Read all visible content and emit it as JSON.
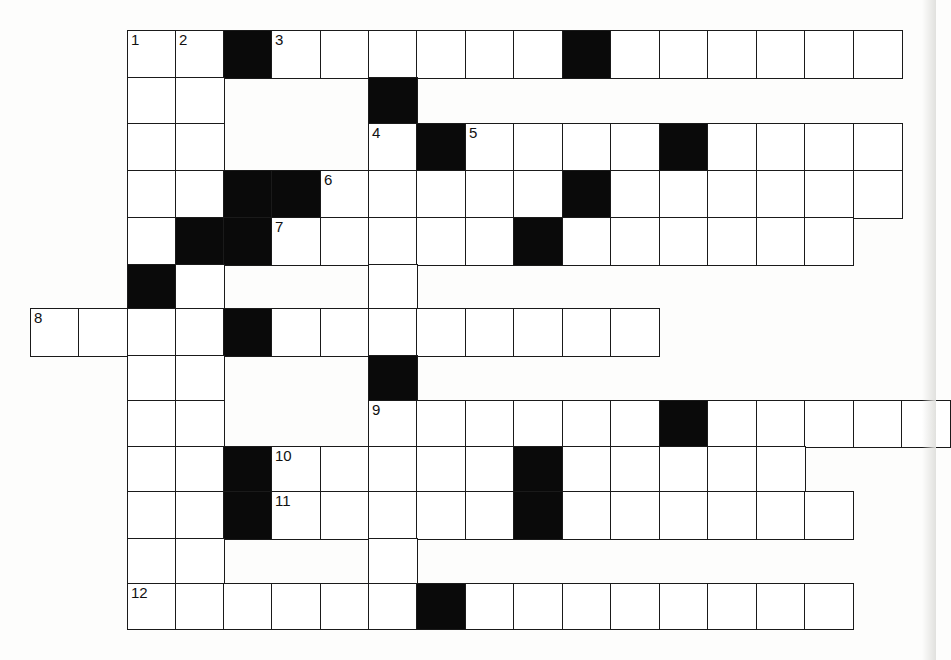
{
  "puzzle": {
    "type": "crossword",
    "colors": {
      "cell": "#ffffff",
      "block": "#0a0a0a",
      "line": "#1a1a1a",
      "background": "#fdfdfc"
    },
    "geometry": {
      "col_x": {
        "-2": 30,
        "-1": 78,
        "0": 127,
        "1": 175,
        "2": 223,
        "3": 271,
        "4": 320,
        "5": 368,
        "6": 416,
        "7": 465,
        "8": 513,
        "9": 562,
        "10": 610,
        "11": 659,
        "12": 707,
        "13": 756,
        "14": 804,
        "15": 853,
        "16": 901
      },
      "row_y": [
        30,
        77,
        123,
        170,
        217,
        264,
        308,
        355,
        400,
        446,
        491,
        538,
        583
      ],
      "row_h": [
        48,
        47,
        48,
        48,
        48,
        45,
        48,
        46,
        47,
        46,
        48,
        46,
        46
      ],
      "cell_w": 49
    },
    "rows": [
      {
        "r": 0,
        "cells": [
          {
            "c": 0,
            "n": "1"
          },
          {
            "c": 1,
            "n": "2"
          },
          {
            "c": 2,
            "b": true
          },
          {
            "c": 3,
            "n": "3"
          },
          {
            "c": 4
          },
          {
            "c": 5
          },
          {
            "c": 6
          },
          {
            "c": 7
          },
          {
            "c": 8
          },
          {
            "c": 9,
            "b": true
          },
          {
            "c": 10
          },
          {
            "c": 11
          },
          {
            "c": 12
          },
          {
            "c": 13
          },
          {
            "c": 14
          },
          {
            "c": 15
          }
        ]
      },
      {
        "r": 1,
        "cells": [
          {
            "c": 0
          },
          {
            "c": 1
          },
          {
            "c": 5,
            "b": true
          }
        ]
      },
      {
        "r": 2,
        "cells": [
          {
            "c": 0
          },
          {
            "c": 1
          },
          {
            "c": 5,
            "n": "4"
          },
          {
            "c": 6,
            "b": true
          },
          {
            "c": 7,
            "n": "5"
          },
          {
            "c": 8
          },
          {
            "c": 9
          },
          {
            "c": 10
          },
          {
            "c": 11,
            "b": true
          },
          {
            "c": 12
          },
          {
            "c": 13
          },
          {
            "c": 14
          },
          {
            "c": 15
          }
        ]
      },
      {
        "r": 3,
        "cells": [
          {
            "c": 0
          },
          {
            "c": 1
          },
          {
            "c": 2,
            "b": true
          },
          {
            "c": 3,
            "b": true
          },
          {
            "c": 4,
            "n": "6"
          },
          {
            "c": 5
          },
          {
            "c": 6
          },
          {
            "c": 7
          },
          {
            "c": 8
          },
          {
            "c": 9,
            "b": true
          },
          {
            "c": 10
          },
          {
            "c": 11
          },
          {
            "c": 12
          },
          {
            "c": 13
          },
          {
            "c": 14
          },
          {
            "c": 15
          }
        ]
      },
      {
        "r": 4,
        "cells": [
          {
            "c": 0
          },
          {
            "c": 1,
            "b": true
          },
          {
            "c": 2,
            "b": true
          },
          {
            "c": 3,
            "n": "7"
          },
          {
            "c": 4
          },
          {
            "c": 5
          },
          {
            "c": 6
          },
          {
            "c": 7
          },
          {
            "c": 8,
            "b": true
          },
          {
            "c": 9
          },
          {
            "c": 10
          },
          {
            "c": 11
          },
          {
            "c": 12
          },
          {
            "c": 13
          },
          {
            "c": 14
          }
        ]
      },
      {
        "r": 5,
        "cells": [
          {
            "c": 0,
            "b": true
          },
          {
            "c": 1
          },
          {
            "c": 5
          }
        ]
      },
      {
        "r": 6,
        "cells": [
          {
            "c": -2,
            "n": "8"
          },
          {
            "c": -1
          },
          {
            "c": 0
          },
          {
            "c": 1
          },
          {
            "c": 2,
            "b": true
          },
          {
            "c": 3
          },
          {
            "c": 4
          },
          {
            "c": 5
          },
          {
            "c": 6
          },
          {
            "c": 7
          },
          {
            "c": 8
          },
          {
            "c": 9
          },
          {
            "c": 10
          }
        ]
      },
      {
        "r": 7,
        "cells": [
          {
            "c": 0
          },
          {
            "c": 1
          },
          {
            "c": 5,
            "b": true
          }
        ]
      },
      {
        "r": 8,
        "cells": [
          {
            "c": 0
          },
          {
            "c": 1
          },
          {
            "c": 5,
            "n": "9"
          },
          {
            "c": 6
          },
          {
            "c": 7
          },
          {
            "c": 8
          },
          {
            "c": 9
          },
          {
            "c": 10
          },
          {
            "c": 11,
            "b": true
          },
          {
            "c": 12
          },
          {
            "c": 13
          },
          {
            "c": 14
          },
          {
            "c": 15
          },
          {
            "c": 16
          }
        ]
      },
      {
        "r": 9,
        "cells": [
          {
            "c": 0
          },
          {
            "c": 1
          },
          {
            "c": 2,
            "b": true
          },
          {
            "c": 3,
            "n": "10"
          },
          {
            "c": 4
          },
          {
            "c": 5
          },
          {
            "c": 6
          },
          {
            "c": 7
          },
          {
            "c": 8,
            "b": true
          },
          {
            "c": 9
          },
          {
            "c": 10
          },
          {
            "c": 11
          },
          {
            "c": 12
          },
          {
            "c": 13
          }
        ]
      },
      {
        "r": 10,
        "cells": [
          {
            "c": 0
          },
          {
            "c": 1
          },
          {
            "c": 2,
            "b": true
          },
          {
            "c": 3,
            "n": "11"
          },
          {
            "c": 4
          },
          {
            "c": 5
          },
          {
            "c": 6
          },
          {
            "c": 7
          },
          {
            "c": 8,
            "b": true
          },
          {
            "c": 9
          },
          {
            "c": 10
          },
          {
            "c": 11
          },
          {
            "c": 12
          },
          {
            "c": 13
          },
          {
            "c": 14
          }
        ]
      },
      {
        "r": 11,
        "cells": [
          {
            "c": 0
          },
          {
            "c": 1
          },
          {
            "c": 5
          }
        ]
      },
      {
        "r": 12,
        "cells": [
          {
            "c": 0,
            "n": "12"
          },
          {
            "c": 1
          },
          {
            "c": 2
          },
          {
            "c": 3
          },
          {
            "c": 4
          },
          {
            "c": 5
          },
          {
            "c": 6,
            "b": true
          },
          {
            "c": 7
          },
          {
            "c": 8
          },
          {
            "c": 9
          },
          {
            "c": 10
          },
          {
            "c": 11
          },
          {
            "c": 12
          },
          {
            "c": 13
          },
          {
            "c": 14
          }
        ]
      }
    ],
    "clue_numbers": [
      "1",
      "2",
      "3",
      "4",
      "5",
      "6",
      "7",
      "8",
      "9",
      "10",
      "11",
      "12"
    ]
  }
}
